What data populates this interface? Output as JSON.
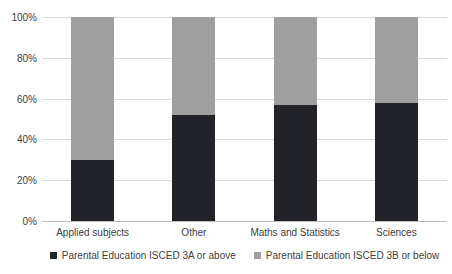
{
  "chart_data": {
    "type": "bar",
    "stacked": true,
    "orientation": "vertical",
    "title": "",
    "xlabel": "",
    "ylabel": "",
    "categories": [
      "Applied subjects",
      "Other",
      "Maths and Statistics",
      "Sciences"
    ],
    "series": [
      {
        "name": "Parental Education ISCED 3A or above",
        "color": "#212328",
        "values": [
          30,
          52,
          57,
          58
        ]
      },
      {
        "name": "Parental Education ISCED 3B or below",
        "color": "#9f9f9f",
        "values": [
          70,
          48,
          43,
          42
        ]
      }
    ],
    "ylim": [
      0,
      100
    ],
    "yticks": [
      {
        "value": 0,
        "label": "0%"
      },
      {
        "value": 20,
        "label": "20%"
      },
      {
        "value": 40,
        "label": "40%"
      },
      {
        "value": 60,
        "label": "60%"
      },
      {
        "value": 80,
        "label": "80%"
      },
      {
        "value": 100,
        "label": "100%"
      }
    ],
    "grid": true,
    "legend_position": "bottom",
    "style_colors": {
      "gridline": "#d9d9d9",
      "axis_line": "#bfbfbf",
      "text": "#404040",
      "background": "#ffffff"
    }
  }
}
